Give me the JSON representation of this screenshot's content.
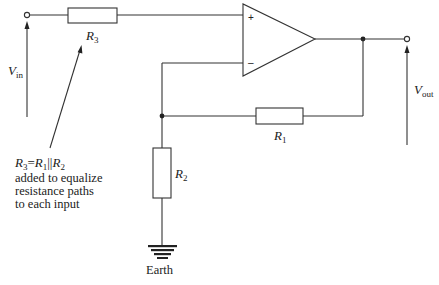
{
  "diagram": {
    "type": "circuit",
    "components": {
      "R1": {
        "label": "R",
        "sub": "1"
      },
      "R2": {
        "label": "R",
        "sub": "2"
      },
      "R3": {
        "label": "R",
        "sub": "3"
      },
      "opamp": {
        "plus": "+",
        "minus": "–"
      }
    },
    "labels": {
      "vin": {
        "main": "V",
        "sub": "in"
      },
      "vout": {
        "main": "V",
        "sub": "out"
      },
      "earth": "Earth"
    },
    "annotation": {
      "formula": {
        "r3": "R",
        "r3_sub": "3",
        "eq": "=",
        "r1": "R",
        "r1_sub": "1",
        "par": "||",
        "r2": "R",
        "r2_sub": "2"
      },
      "lines": [
        "added to equalize",
        "resistance paths",
        "to each input"
      ]
    }
  }
}
